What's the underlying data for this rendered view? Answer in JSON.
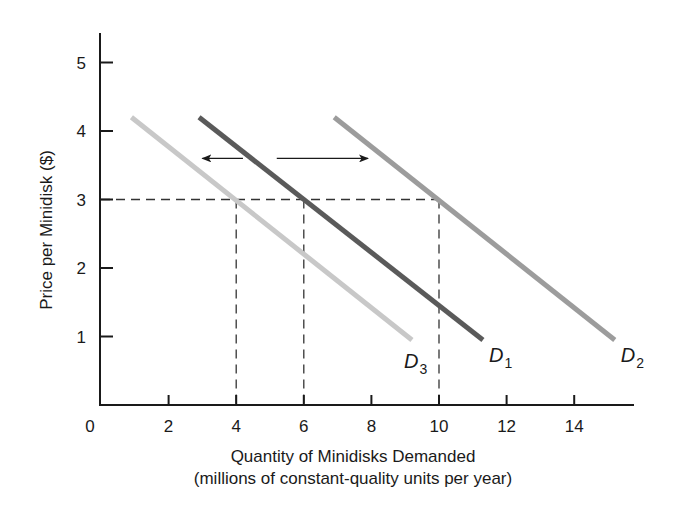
{
  "chart_data": {
    "type": "line",
    "title": "",
    "xlabel": "Quantity of Minidisks Demanded",
    "xlabel_sub": "(millions of constant-quality units per year)",
    "ylabel": "Price per Minidisk ($)",
    "xlim": [
      0,
      15.8
    ],
    "ylim": [
      0,
      5.4
    ],
    "grid": false,
    "legend": "none (direct curve labels)",
    "x_ticks": [
      0,
      2,
      4,
      6,
      8,
      10,
      12,
      14
    ],
    "y_ticks": [
      1,
      2,
      3,
      4,
      5
    ],
    "series": [
      {
        "name": "D1",
        "label_main": "D",
        "label_sub": "1",
        "color": "#5a5a5a",
        "x": [
          2.9,
          11.3
        ],
        "y": [
          4.2,
          0.95
        ]
      },
      {
        "name": "D2",
        "label_main": "D",
        "label_sub": "2",
        "color": "#9c9c9c",
        "x": [
          6.9,
          15.2
        ],
        "y": [
          4.2,
          0.95
        ]
      },
      {
        "name": "D3",
        "label_main": "D",
        "label_sub": "3",
        "color": "#c8c8c8",
        "x": [
          0.9,
          9.2
        ],
        "y": [
          4.2,
          0.95
        ]
      }
    ],
    "reference_lines": {
      "horizontal": {
        "y": 3,
        "x_from": 0,
        "x_to": 10,
        "style": "dashed"
      },
      "vertical": [
        {
          "x": 4,
          "y_from": 0,
          "y_to": 3,
          "style": "dashed",
          "note": "D3 at P=3"
        },
        {
          "x": 6,
          "y_from": 0,
          "y_to": 3,
          "style": "dashed",
          "note": "D1 at P=3"
        },
        {
          "x": 10,
          "y_from": 0,
          "y_to": 3,
          "style": "dashed",
          "note": "D2 at P=3"
        }
      ]
    },
    "annotations": [
      {
        "type": "arrow",
        "direction": "left",
        "x_from": 4.2,
        "x_to": 3.0,
        "y": 3.6,
        "meaning": "shift from D1 to D3 (decrease in demand)"
      },
      {
        "type": "arrow",
        "direction": "right",
        "x_from": 5.2,
        "x_to": 7.9,
        "y": 3.6,
        "meaning": "shift from D1 to D2 (increase in demand)"
      }
    ],
    "points_at_price_3": [
      {
        "curve": "D3",
        "quantity": 4,
        "price": 3
      },
      {
        "curve": "D1",
        "quantity": 6,
        "price": 3
      },
      {
        "curve": "D2",
        "quantity": 10,
        "price": 3
      }
    ]
  }
}
